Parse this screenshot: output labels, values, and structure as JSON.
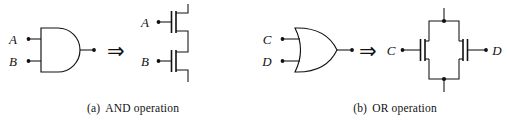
{
  "figure": {
    "kind": "logic-gate-to-transistor-equivalence",
    "background_color": "#ffffff",
    "ink_color": "#111111"
  },
  "panels": [
    {
      "id": "a",
      "caption_tag": "(a)",
      "caption_text": "AND operation",
      "gate": {
        "type": "AND",
        "shape": "d-shape",
        "inputs": [
          {
            "label": "A"
          },
          {
            "label": "B"
          }
        ],
        "output": {
          "label": ""
        }
      },
      "equivalence_symbol": "⇒",
      "transistor_network": {
        "topology": "series",
        "device_type": "NMOS",
        "count": 2,
        "gates": [
          {
            "label": "A"
          },
          {
            "label": "B"
          }
        ],
        "terminal_top": "",
        "terminal_bottom": ""
      }
    },
    {
      "id": "b",
      "caption_tag": "(b)",
      "caption_text": "OR operation",
      "gate": {
        "type": "OR",
        "shape": "curved-shield",
        "inputs": [
          {
            "label": "C"
          },
          {
            "label": "D"
          }
        ],
        "output": {
          "label": ""
        }
      },
      "equivalence_symbol": "⇒",
      "transistor_network": {
        "topology": "parallel",
        "device_type": "NMOS",
        "count": 2,
        "gates": [
          {
            "label": "C"
          },
          {
            "label": "D"
          }
        ],
        "terminal_left": "C",
        "terminal_right": "D"
      }
    }
  ]
}
